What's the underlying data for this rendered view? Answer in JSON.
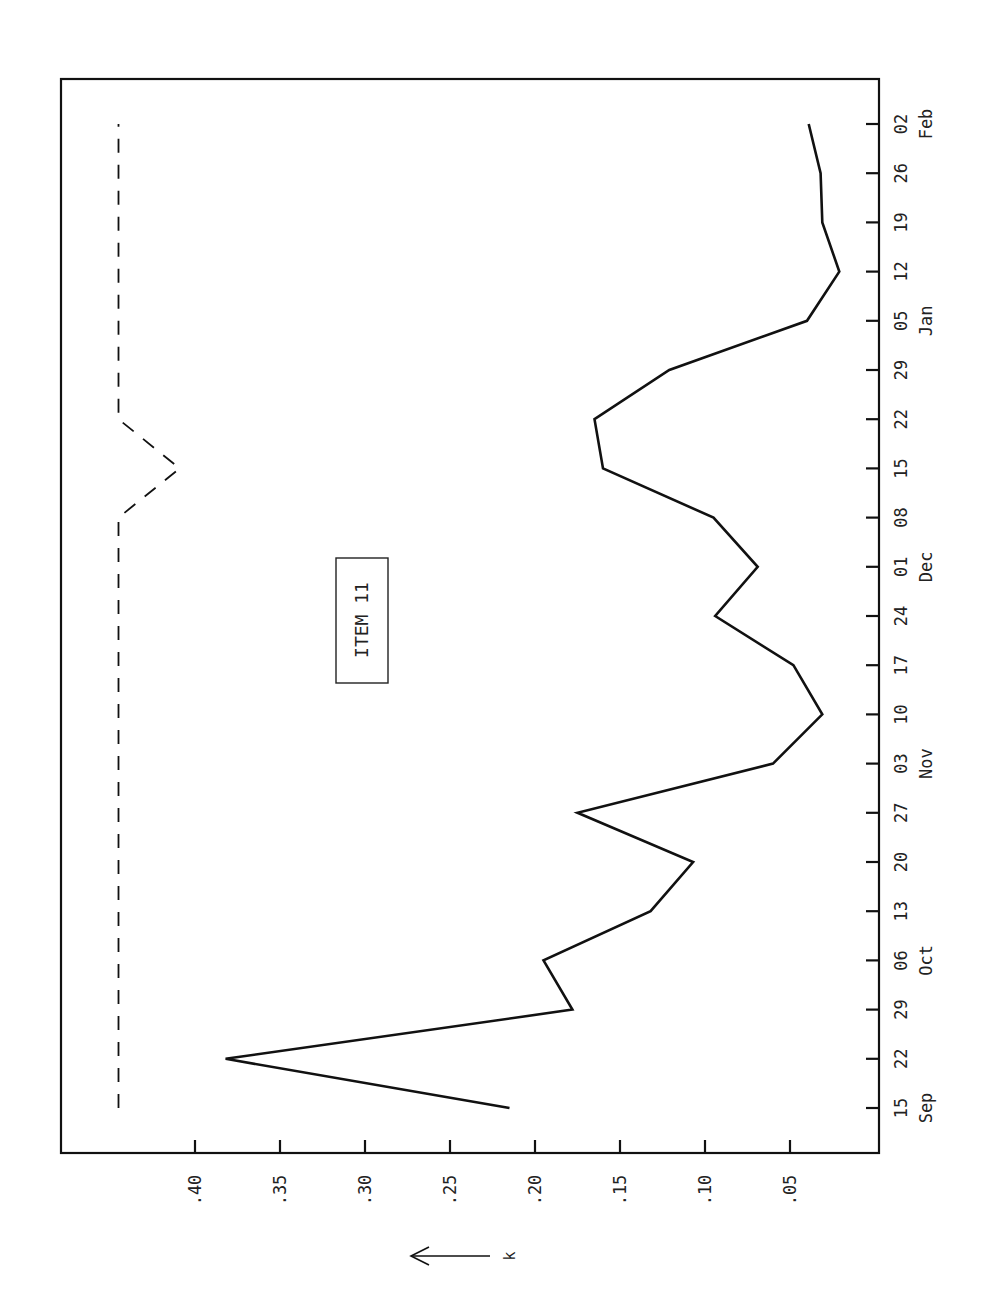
{
  "chart_data": {
    "type": "line",
    "orientation": "rotated-90-ccw",
    "title": "",
    "annotation": "ITEM 11",
    "xlabel": "",
    "ylabel": "k",
    "ylabel_arrow": "left-arrow",
    "ylim": [
      0,
      0.45
    ],
    "y_ticks": [
      ".40",
      ".35",
      ".30",
      ".25",
      ".20",
      ".15",
      ".10",
      ".05"
    ],
    "y_tick_values": [
      0.4,
      0.35,
      0.3,
      0.25,
      0.2,
      0.15,
      0.1,
      0.05
    ],
    "x_tick_labels": [
      "15",
      "22",
      "29",
      "06",
      "13",
      "20",
      "27",
      "03",
      "10",
      "17",
      "24",
      "01",
      "08",
      "15",
      "22",
      "29",
      "05",
      "12",
      "19",
      "26",
      "02"
    ],
    "x_month_labels": [
      {
        "label": "Sep",
        "index": 0
      },
      {
        "label": "Oct",
        "index": 3
      },
      {
        "label": "Nov",
        "index": 7
      },
      {
        "label": "Dec",
        "index": 11
      },
      {
        "label": "Jan",
        "index": 16
      },
      {
        "label": "Feb",
        "index": 20
      }
    ],
    "categories": [
      "Sep 15",
      "Sep 22",
      "Sep 29",
      "Oct 06",
      "Oct 13",
      "Oct 20",
      "Oct 27",
      "Nov 03",
      "Nov 10",
      "Nov 17",
      "Nov 24",
      "Dec 01",
      "Dec 08",
      "Dec 15",
      "Dec 22",
      "Dec 29",
      "Jan 05",
      "Jan 12",
      "Jan 19",
      "Jan 26",
      "Feb 02"
    ],
    "series": [
      {
        "name": "k (observed)",
        "style": "solid",
        "values": [
          0.215,
          0.382,
          0.178,
          0.195,
          0.132,
          0.107,
          0.175,
          0.06,
          0.031,
          0.048,
          0.094,
          0.069,
          0.095,
          0.16,
          0.165,
          0.121,
          0.04,
          0.021,
          0.031,
          0.032,
          0.039
        ]
      },
      {
        "name": "limit",
        "style": "dashed",
        "values": [
          0.445,
          0.445,
          0.445,
          0.445,
          0.445,
          0.445,
          0.445,
          0.445,
          0.445,
          0.445,
          0.445,
          0.445,
          0.445,
          0.409,
          0.445,
          0.445,
          0.445,
          0.445,
          0.445,
          0.445,
          0.445
        ]
      }
    ],
    "grid": false,
    "legend": "none"
  }
}
